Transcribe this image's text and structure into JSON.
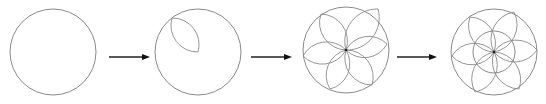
{
  "diagram": {
    "title": "",
    "colors": {
      "stroke": "#8a8a8a",
      "arrow": "#222222",
      "background": "#ffffff"
    },
    "steps": [
      {
        "id": 1,
        "label": "",
        "shape": "circle",
        "center": [
          53,
          52
        ],
        "radius": 43,
        "petals": [],
        "inner_circle": null
      },
      {
        "id": 2,
        "label": "",
        "shape": "circle-with-one-petal",
        "center": [
          198,
          52
        ],
        "radius": 43,
        "petals": [
          [
            172,
            18
          ]
        ],
        "inner_circle": null
      },
      {
        "id": 3,
        "label": "",
        "shape": "circle-with-six-petals",
        "center": [
          346,
          50
        ],
        "radius": 43,
        "petals": [
          [
            321,
            14
          ],
          [
            378,
            9
          ],
          [
            387,
            44
          ],
          [
            303,
            56
          ],
          [
            330,
            89
          ],
          [
            372,
            85
          ]
        ],
        "inner_circle": null
      },
      {
        "id": 4,
        "label": "",
        "shape": "circle-with-six-petals-and-inner-circle",
        "center": [
          494,
          52
        ],
        "radius": 43,
        "petals": [
          [
            470,
            17
          ],
          [
            514,
            12
          ],
          [
            537,
            50
          ],
          [
            452,
            56
          ],
          [
            475,
            92
          ],
          [
            519,
            89
          ]
        ],
        "inner_circle": 21
      }
    ],
    "arrows": [
      {
        "from": [
          109,
          57
        ],
        "to": [
          150,
          57
        ]
      },
      {
        "from": [
          251,
          57
        ],
        "to": [
          292,
          57
        ]
      },
      {
        "from": [
          397,
          57
        ],
        "to": [
          437,
          57
        ]
      }
    ]
  }
}
